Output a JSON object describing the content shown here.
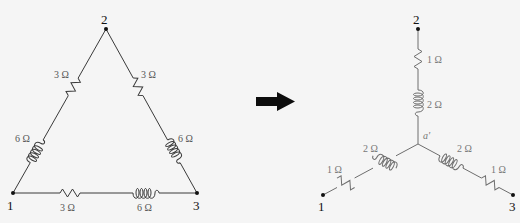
{
  "diagram": {
    "delta": {
      "nodes": [
        {
          "id": "1",
          "label": "1"
        },
        {
          "id": "2",
          "label": "2"
        },
        {
          "id": "3",
          "label": "3"
        }
      ],
      "branches": [
        {
          "between": "1-2",
          "components": [
            {
              "type": "inductor",
              "label": "6 Ω"
            },
            {
              "type": "resistor",
              "label": "3 Ω"
            }
          ]
        },
        {
          "between": "2-3",
          "components": [
            {
              "type": "resistor",
              "label": "3 Ω"
            },
            {
              "type": "inductor",
              "label": "6 Ω"
            }
          ]
        },
        {
          "between": "1-3",
          "components": [
            {
              "type": "resistor",
              "label": "3 Ω"
            },
            {
              "type": "inductor",
              "label": "6 Ω"
            }
          ]
        }
      ]
    },
    "arrow": {
      "icon": "right-arrow-icon"
    },
    "wye": {
      "center": {
        "label": "a'"
      },
      "nodes": [
        {
          "id": "1",
          "label": "1"
        },
        {
          "id": "2",
          "label": "2"
        },
        {
          "id": "3",
          "label": "3"
        }
      ],
      "arms": [
        {
          "to": "2",
          "components": [
            {
              "type": "resistor",
              "label": "1 Ω"
            },
            {
              "type": "inductor",
              "label": "2 Ω"
            }
          ]
        },
        {
          "to": "1",
          "components": [
            {
              "type": "inductor",
              "label": "2 Ω"
            },
            {
              "type": "resistor",
              "label": "1 Ω"
            }
          ]
        },
        {
          "to": "3",
          "components": [
            {
              "type": "inductor",
              "label": "2 Ω"
            },
            {
              "type": "resistor",
              "label": "1 Ω"
            }
          ]
        }
      ]
    }
  }
}
